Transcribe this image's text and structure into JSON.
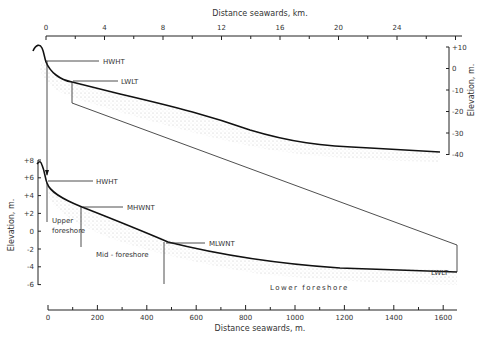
{
  "top_plot": {
    "x_axis_title": "Distance seawards, km.",
    "x_ticks": [
      "0",
      "4",
      "8",
      "12",
      "16",
      "20",
      "24"
    ],
    "y_axis_title": "Elevation, m.",
    "y_ticks": [
      "+10",
      "0",
      "-10",
      "-20",
      "-30",
      "-40"
    ],
    "labels": {
      "hwht": "HWHT",
      "lwlt": "LWLT"
    }
  },
  "bottom_plot": {
    "x_axis_title": "Distance seawards, m.",
    "x_ticks": [
      "0",
      "200",
      "400",
      "600",
      "800",
      "1000",
      "1200",
      "1400",
      "1600"
    ],
    "y_axis_title": "Elevation, m.",
    "y_ticks": [
      "+8",
      "+6",
      "+4",
      "+2",
      "0",
      "-2",
      "-4",
      "-6"
    ],
    "labels": {
      "hwht": "HWHT",
      "mhwnt": "MHWNT",
      "mlwnt": "MLWNT",
      "lwlt": "LWLT",
      "upper": "Upper",
      "foreshore_upper": "foreshore",
      "mid": "Mid - foreshore",
      "lower": "Lower   foreshore"
    }
  }
}
